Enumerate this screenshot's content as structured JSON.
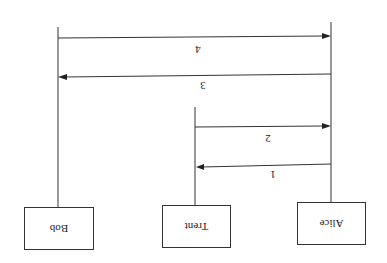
{
  "diagram": {
    "type": "sequence",
    "orientation": "rotated-180",
    "actors": [
      {
        "name": "Bob",
        "lifeline_x": 58,
        "box": {
          "x": 24,
          "y": 207,
          "w": 70,
          "h": 43
        },
        "lifeline_top": 27
      },
      {
        "name": "Trent",
        "lifeline_x": 195,
        "box": {
          "x": 162,
          "y": 205,
          "w": 69,
          "h": 43
        },
        "lifeline_top": 107
      },
      {
        "name": "Alice",
        "lifeline_x": 331,
        "box": {
          "x": 297,
          "y": 202,
          "w": 69,
          "h": 43
        },
        "lifeline_top": 22
      }
    ],
    "messages": [
      {
        "label": "1",
        "from": "Alice",
        "to": "Trent",
        "y": 166,
        "label_y": 174
      },
      {
        "label": "2",
        "from": "Trent",
        "to": "Alice",
        "y": 126,
        "label_y": 138
      },
      {
        "label": "3",
        "from": "Alice",
        "to": "Bob",
        "y": 75,
        "label_y": 86
      },
      {
        "label": "4",
        "from": "Bob",
        "to": "Alice",
        "y": 37,
        "label_y": 50
      }
    ]
  }
}
